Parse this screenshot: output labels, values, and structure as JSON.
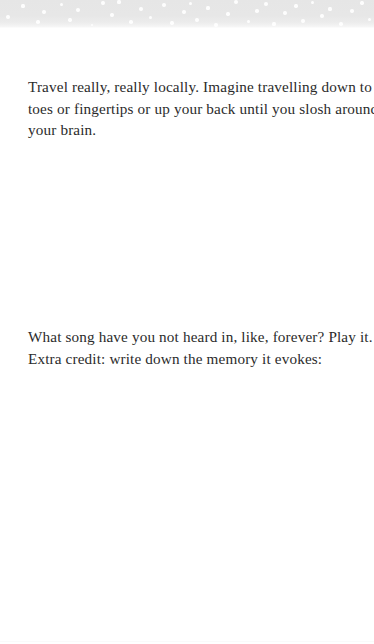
{
  "page": {
    "background_color": "#ffffff",
    "text_color": "#2b2b2b"
  },
  "banner": {
    "name": "dotted-gradient-banner",
    "background_color": "#e7e7e7",
    "dot_color": "#ffffff",
    "dots": [
      {
        "x": 8,
        "y": 17,
        "r": 2.0
      },
      {
        "x": 23,
        "y": 6,
        "r": 1.6
      },
      {
        "x": 38,
        "y": 22,
        "r": 1.8
      },
      {
        "x": 44,
        "y": 12,
        "r": 2.2
      },
      {
        "x": 61,
        "y": 4,
        "r": 1.5
      },
      {
        "x": 70,
        "y": 20,
        "r": 1.7
      },
      {
        "x": 78,
        "y": 10,
        "r": 2.1
      },
      {
        "x": 92,
        "y": 25,
        "r": 1.4
      },
      {
        "x": 103,
        "y": 3,
        "r": 1.9
      },
      {
        "x": 112,
        "y": 15,
        "r": 2.3
      },
      {
        "x": 119,
        "y": 2,
        "r": 1.6
      },
      {
        "x": 131,
        "y": 22,
        "r": 1.8
      },
      {
        "x": 141,
        "y": 9,
        "r": 2.0
      },
      {
        "x": 150,
        "y": 17,
        "r": 1.5
      },
      {
        "x": 164,
        "y": 5,
        "r": 2.2
      },
      {
        "x": 172,
        "y": 23,
        "r": 1.7
      },
      {
        "x": 184,
        "y": 12,
        "r": 2.4
      },
      {
        "x": 190,
        "y": 3,
        "r": 1.5
      },
      {
        "x": 197,
        "y": 20,
        "r": 1.9
      },
      {
        "x": 208,
        "y": 8,
        "r": 1.6
      },
      {
        "x": 216,
        "y": 25,
        "r": 2.0
      },
      {
        "x": 228,
        "y": 14,
        "r": 1.7
      },
      {
        "x": 236,
        "y": 2,
        "r": 2.1
      },
      {
        "x": 248,
        "y": 21,
        "r": 1.5
      },
      {
        "x": 257,
        "y": 11,
        "r": 1.8
      },
      {
        "x": 266,
        "y": 4,
        "r": 2.2
      },
      {
        "x": 274,
        "y": 24,
        "r": 1.6
      },
      {
        "x": 285,
        "y": 13,
        "r": 2.0
      },
      {
        "x": 296,
        "y": 6,
        "r": 1.7
      },
      {
        "x": 303,
        "y": 21,
        "r": 1.9
      },
      {
        "x": 312,
        "y": 2,
        "r": 1.5
      },
      {
        "x": 322,
        "y": 16,
        "r": 2.3
      },
      {
        "x": 330,
        "y": 9,
        "r": 1.6
      },
      {
        "x": 341,
        "y": 24,
        "r": 1.8
      },
      {
        "x": 352,
        "y": 11,
        "r": 2.1
      },
      {
        "x": 362,
        "y": 3,
        "r": 1.7
      },
      {
        "x": 369,
        "y": 19,
        "r": 1.5
      }
    ]
  },
  "paragraphs": [
    {
      "id": "travel",
      "lines": [
        "Travel really, really locally. Imagine travelling down to your",
        "toes or fingertips or up your back until you slosh around",
        "your brain."
      ]
    },
    {
      "id": "song",
      "lines": [
        "What song have you not heard in, like, forever? Play it.",
        "Extra credit: write down the memory it evokes:"
      ]
    }
  ]
}
